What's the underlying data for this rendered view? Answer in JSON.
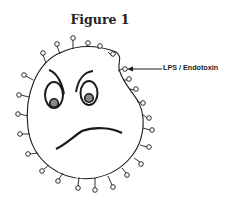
{
  "figure": {
    "title": "Figure 1",
    "annotation": {
      "label": "LPS / Endotoxin",
      "arrow": "arrow-left"
    },
    "colors": {
      "line": "#1a1a1a",
      "background": "#ffffff",
      "pupil": "#888888"
    }
  }
}
